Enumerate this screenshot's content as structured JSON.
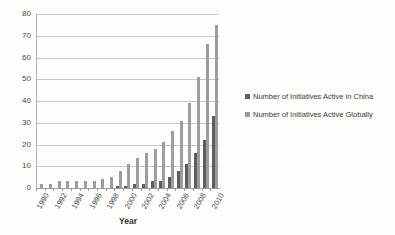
{
  "chart_data": {
    "type": "bar",
    "title": "",
    "xlabel": "Year",
    "ylabel": "",
    "ylim": [
      0,
      80
    ],
    "ytick_step": 10,
    "yticks": [
      80,
      70,
      60,
      50,
      40,
      30,
      20,
      10,
      0
    ],
    "grid": true,
    "legend_position": "right",
    "categories": [
      "1990",
      "1991",
      "1992",
      "1993",
      "1994",
      "1995",
      "1996",
      "1997",
      "1998",
      "1999",
      "2000",
      "2001",
      "2002",
      "2003",
      "2004",
      "2005",
      "2006",
      "2007",
      "2008",
      "2009",
      "2010"
    ],
    "xtick_labels": [
      "1990",
      "",
      "1992",
      "",
      "1994",
      "",
      "1996",
      "",
      "1998",
      "",
      "2000",
      "",
      "2002",
      "",
      "2004",
      "",
      "2006",
      "",
      "2008",
      "",
      "2010"
    ],
    "series": [
      {
        "name": "Number of Initiatives Active in China",
        "color": "#5e5e5e",
        "values": [
          0,
          0,
          0,
          0,
          0,
          0,
          0,
          0,
          0,
          1,
          1,
          2,
          2,
          3,
          3,
          5,
          8,
          11,
          16,
          22,
          33
        ]
      },
      {
        "name": "Number of Initiatives Active Globally",
        "color": "#9d9d9d",
        "values": [
          2,
          2,
          3,
          3,
          3,
          3,
          3,
          4,
          5,
          8,
          11,
          14,
          16,
          18,
          21,
          26,
          31,
          39,
          51,
          66,
          75
        ]
      }
    ]
  },
  "legend": {
    "items": [
      {
        "label": "Number of Initiatives Active in China",
        "swatch": "china"
      },
      {
        "label": "Number of Initiatives Active Globally",
        "swatch": "global"
      }
    ]
  },
  "axis_titles": {
    "x": "Year"
  }
}
